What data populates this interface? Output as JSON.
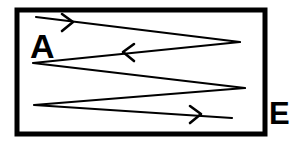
{
  "diagram": {
    "type": "boustrophedon-path",
    "canvas": {
      "width": 294,
      "height": 144,
      "background": "#ffffff"
    },
    "frame": {
      "name": "boundary-rectangle",
      "x": 17,
      "y": 10,
      "width": 248,
      "height": 124,
      "stroke": "#000000",
      "stroke_width": 5,
      "fill": "#ffffff"
    },
    "labels": [
      {
        "id": "start",
        "text": "A",
        "x": 30,
        "y": 58,
        "font_size": 34,
        "color": "#000000",
        "position": "inside-top-left"
      },
      {
        "id": "end",
        "text": "E",
        "x": 269,
        "y": 124,
        "font_size": 31,
        "color": "#000000",
        "position": "outside-right"
      }
    ],
    "path": {
      "name": "zigzag-polyline",
      "stroke": "#000000",
      "stroke_width": 2.2,
      "points": "36,17 240,42 33,63 245,88 34,105 232,118",
      "vertices": [
        {
          "x": 36,
          "y": 17,
          "role": "start"
        },
        {
          "x": 240,
          "y": 42,
          "role": "turn-right-1"
        },
        {
          "x": 33,
          "y": 63,
          "role": "turn-left-1"
        },
        {
          "x": 245,
          "y": 88,
          "role": "turn-right-2"
        },
        {
          "x": 34,
          "y": 105,
          "role": "turn-left-2"
        },
        {
          "x": 232,
          "y": 118,
          "role": "end"
        }
      ]
    },
    "arrowheads": [
      {
        "id": "arrow-1",
        "direction": "right",
        "x": 70,
        "y": 22,
        "segment": 1,
        "points": "62,14 73,22 62,31"
      },
      {
        "id": "arrow-2",
        "direction": "left",
        "x": 126,
        "y": 52,
        "segment": 2,
        "points": "134,44 123,52 134,61"
      },
      {
        "id": "arrow-3",
        "direction": "right",
        "x": 198,
        "y": 114,
        "segment": 5,
        "points": "190,106 201,114 190,123"
      }
    ]
  }
}
